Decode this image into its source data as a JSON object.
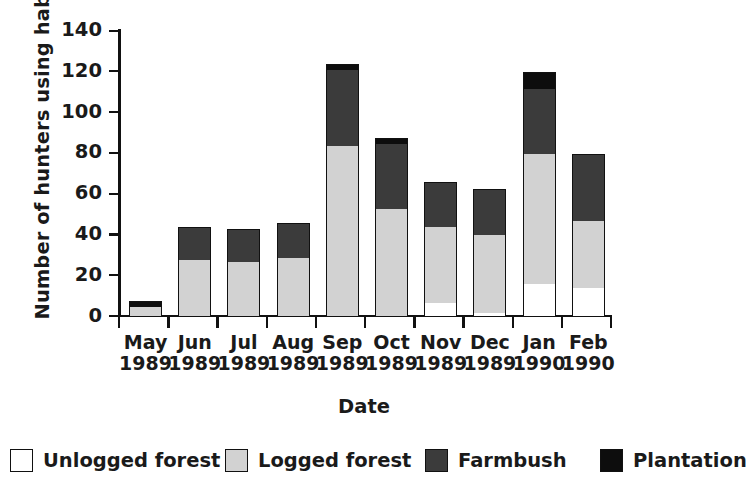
{
  "chart_data": {
    "type": "bar",
    "subtype": "stacked-vertical",
    "title": "",
    "xlabel": "Date",
    "ylabel": "Number of hunters using habitat",
    "ylim": [
      0,
      140
    ],
    "yticks": [
      0,
      20,
      40,
      60,
      80,
      100,
      120,
      140
    ],
    "ytick_labels": [
      "0",
      "20",
      "40",
      "60",
      "80",
      "100",
      "120",
      "140"
    ],
    "grid": false,
    "legend_position": "bottom",
    "categories": [
      "May 1989",
      "Jun 1989",
      "Jul 1989",
      "Aug 1989",
      "Sep 1989",
      "Oct 1989",
      "Nov 1989",
      "Dec 1989",
      "Jan 1990",
      "Feb 1990"
    ],
    "category_lines": [
      {
        "month": "May",
        "year": "1989"
      },
      {
        "month": "Jun",
        "year": "1989"
      },
      {
        "month": "Jul",
        "year": "1989"
      },
      {
        "month": "Aug",
        "year": "1989"
      },
      {
        "month": "Sep",
        "year": "1989"
      },
      {
        "month": "Oct",
        "year": "1989"
      },
      {
        "month": "Nov",
        "year": "1989"
      },
      {
        "month": "Dec",
        "year": "1989"
      },
      {
        "month": "Jan",
        "year": "1990"
      },
      {
        "month": "Feb",
        "year": "1990"
      }
    ],
    "series": [
      {
        "name": "Unlogged forest",
        "color": "#ffffff",
        "values": [
          0,
          0,
          0,
          0,
          0,
          0,
          7,
          2,
          16,
          14
        ]
      },
      {
        "name": "Logged forest",
        "color": "#d2d2d2",
        "values": [
          5,
          28,
          27,
          29,
          84,
          53,
          37,
          38,
          64,
          33
        ]
      },
      {
        "name": "Farmbush",
        "color": "#3b3b3b",
        "values": [
          0,
          16,
          16,
          17,
          37,
          32,
          22,
          23,
          32,
          33
        ]
      },
      {
        "name": "Plantation",
        "color": "#0d0d0d",
        "values": [
          3,
          0,
          0,
          0,
          3,
          3,
          0,
          0,
          8,
          0
        ]
      }
    ],
    "totals": [
      8,
      44,
      43,
      46,
      124,
      88,
      66,
      63,
      120,
      80
    ]
  },
  "legend": {
    "items": [
      {
        "label": "Unlogged forest",
        "key": "unlogged"
      },
      {
        "label": "Logged forest",
        "key": "logged"
      },
      {
        "label": "Farmbush",
        "key": "farmbush"
      },
      {
        "label": "Plantation",
        "key": "plantation"
      }
    ]
  }
}
